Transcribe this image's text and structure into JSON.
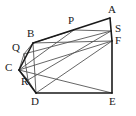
{
  "figure": {
    "type": "geometry-diagram",
    "shape_name": "triangular-prism",
    "canvas": {
      "width": 136,
      "height": 116
    },
    "colors": {
      "background": "#ffffff",
      "outline": "#1a1a1a",
      "interior_line": "#555555",
      "label": "#1a1a1a"
    },
    "stroke": {
      "outline_width": 1.6,
      "interior_width": 0.9
    },
    "vertices": [
      {
        "id": "A",
        "label": "A",
        "x": 110,
        "y": 18,
        "label_x": 108,
        "label_y": 4,
        "kind": "outline"
      },
      {
        "id": "B",
        "label": "B",
        "x": 33,
        "y": 43,
        "label_x": 27,
        "label_y": 28,
        "kind": "outline"
      },
      {
        "id": "C",
        "label": "C",
        "x": 19,
        "y": 70,
        "label_x": 5,
        "label_y": 62,
        "kind": "outline"
      },
      {
        "id": "D",
        "label": "D",
        "x": 36,
        "y": 93,
        "label_x": 31,
        "label_y": 96,
        "kind": "outline"
      },
      {
        "id": "E",
        "label": "E",
        "x": 112,
        "y": 93,
        "label_x": 109,
        "label_y": 96,
        "kind": "outline"
      },
      {
        "id": "F",
        "label": "F",
        "x": 112,
        "y": 41,
        "label_x": 115,
        "label_y": 35,
        "kind": "outline"
      },
      {
        "id": "S",
        "label": "S",
        "x": 111,
        "y": 31,
        "label_x": 115,
        "label_y": 23,
        "kind": "marked-point"
      },
      {
        "id": "P",
        "label": "P",
        "x": 74,
        "y": 30,
        "label_x": 68,
        "label_y": 15,
        "kind": "marked-point"
      },
      {
        "id": "Q",
        "label": "Q",
        "x": 24,
        "y": 54,
        "label_x": 12,
        "label_y": 42,
        "kind": "marked-point"
      },
      {
        "id": "R",
        "label": "R",
        "x": 28,
        "y": 80,
        "label_x": 21,
        "label_y": 76,
        "kind": "marked-point"
      }
    ],
    "outline_edges": [
      {
        "name": "edge-A-B",
        "from": "A",
        "to": "B"
      },
      {
        "name": "edge-B-C",
        "from": "B",
        "to": "C"
      },
      {
        "name": "edge-C-D",
        "from": "C",
        "to": "D"
      },
      {
        "name": "edge-D-E",
        "from": "D",
        "to": "E"
      },
      {
        "name": "edge-E-F",
        "from": "E",
        "to": "F"
      },
      {
        "name": "edge-F-A",
        "from": "F",
        "to": "A"
      }
    ],
    "interior_edges": [
      {
        "name": "edge-B-F",
        "from": "B",
        "to": "F"
      },
      {
        "name": "edge-C-E",
        "from": "C",
        "to": "E"
      },
      {
        "name": "edge-D-F",
        "from": "D",
        "to": "F"
      },
      {
        "name": "edge-B-D",
        "from": "B",
        "to": "D"
      },
      {
        "name": "edge-C-F",
        "from": "C",
        "to": "F"
      },
      {
        "name": "edge-Q-S",
        "from": "Q",
        "to": "S"
      },
      {
        "name": "edge-R-S",
        "from": "R",
        "to": "S"
      },
      {
        "name": "edge-Q-R",
        "from": "Q",
        "to": "R"
      },
      {
        "name": "edge-A-P-line",
        "from": "P",
        "to": "C"
      },
      {
        "name": "edge-S-P-top",
        "from": "S",
        "to": "P"
      },
      {
        "name": "edge-P-B",
        "from": "P",
        "to": "B"
      },
      {
        "name": "edge-R-D",
        "from": "R",
        "to": "D"
      },
      {
        "name": "edge-C-R",
        "from": "C",
        "to": "R"
      },
      {
        "name": "edge-Q-C",
        "from": "Q",
        "to": "C"
      },
      {
        "name": "edge-B-Q",
        "from": "B",
        "to": "Q"
      }
    ]
  }
}
